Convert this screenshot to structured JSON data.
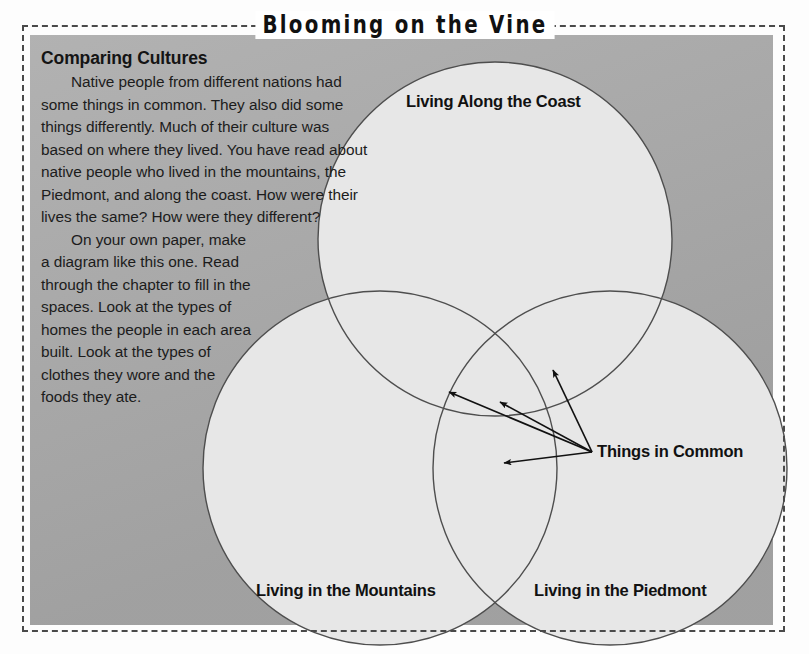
{
  "page": {
    "title": "Blooming on the Vine",
    "background_color": "#ffffff",
    "panel_color": "#a9a9a9",
    "circle_fill": "#e7e7e7",
    "circle_stroke": "#4e4e4e",
    "border_style": "dashed",
    "border_color": "#4a4a4a"
  },
  "article": {
    "heading": "Comparing Cultures",
    "paragraph_1": "Native people from different nations had some things in common.  They also did some things differently.  Much of their culture was based on where they lived. You have read about native people who lived in the mountains, the Piedmont, and along the coast.  How were their lives the same?  How were they different?",
    "paragraph_2": "On your own paper, make a diagram like this one.  Read through the chapter to fill in the spaces.  Look at the types of homes the people in each area built.  Look at the types of clothes they wore and the foods they ate."
  },
  "diagram": {
    "type": "venn-3-circle",
    "circles": [
      {
        "id": "coast",
        "label": "Living Along the Coast",
        "cx": 495,
        "cy": 239,
        "r": 177
      },
      {
        "id": "mountains",
        "label": "Living in the Mountains",
        "cx": 380,
        "cy": 468,
        "r": 177
      },
      {
        "id": "piedmont",
        "label": "Living in the Piedmont",
        "cx": 610,
        "cy": 468,
        "r": 177
      }
    ],
    "callout": {
      "label": "Things in Common",
      "origin_x": 592,
      "origin_y": 452,
      "arrow_tips": [
        {
          "x": 446,
          "y": 390,
          "region": "coast-mountains"
        },
        {
          "x": 497,
          "y": 400,
          "region": "coast-mountains-piedmont"
        },
        {
          "x": 551,
          "y": 367,
          "region": "coast-piedmont"
        },
        {
          "x": 501,
          "y": 463,
          "region": "mountains-piedmont"
        }
      ]
    }
  }
}
